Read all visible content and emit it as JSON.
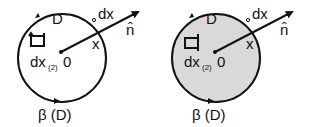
{
  "figure": {
    "panels": [
      {
        "id": "left",
        "filled": false,
        "fill_color": "#ffffff",
        "labels": {
          "region": "D",
          "boundary": "β (D)",
          "origin": "0",
          "point": "x",
          "line_element": "dx",
          "area_element": "dx",
          "area_element_sub": "(2)",
          "normal": "n̂"
        }
      },
      {
        "id": "right",
        "filled": true,
        "fill_color": "#d9d9d9",
        "labels": {
          "region": "D",
          "boundary": "β (D)",
          "origin": "0",
          "point": "x",
          "line_element": "dx",
          "area_element": "dx",
          "area_element_sub": "(2)",
          "normal": "n̂"
        }
      }
    ],
    "stroke_color": "#111111"
  }
}
